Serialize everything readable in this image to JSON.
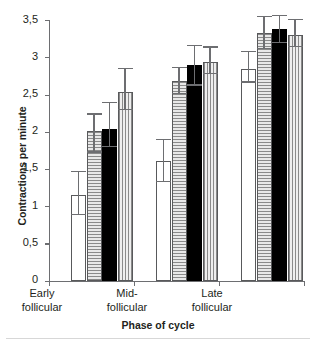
{
  "chart_data": {
    "type": "bar",
    "title": "",
    "xlabel": "Phase of cycle",
    "ylabel": "Contractions per minute",
    "categories": [
      "Early follicular",
      "Mid-follicular",
      "Late follicular"
    ],
    "ylim": [
      0,
      3.5
    ],
    "yticks": [
      0,
      0.5,
      1,
      1.5,
      2,
      2.5,
      3,
      3.5
    ],
    "ytick_labels": [
      "0",
      "0,5",
      "1",
      "1,5",
      "2",
      "2,5",
      "3",
      "3,5"
    ],
    "grid": false,
    "legend": "none",
    "decimal_separator": ",",
    "series": [
      {
        "name": "series-1",
        "fill": "white",
        "values": [
          1.15,
          1.6,
          2.84
        ],
        "err_low": [
          0.88,
          1.33,
          2.66
        ],
        "err_high": [
          1.46,
          1.89,
          3.07
        ]
      },
      {
        "name": "series-2",
        "fill": "horizontal-stripes",
        "values": [
          2.01,
          2.68,
          3.32
        ],
        "err_low": [
          1.72,
          2.51,
          3.11
        ],
        "err_high": [
          2.23,
          2.86,
          3.54
        ]
      },
      {
        "name": "series-3",
        "fill": "black",
        "values": [
          2.04,
          2.89,
          3.38
        ],
        "err_low": [
          1.8,
          2.62,
          3.19
        ],
        "err_high": [
          2.38,
          3.15,
          3.55
        ]
      },
      {
        "name": "series-4",
        "fill": "vertical-stripes",
        "values": [
          2.54,
          2.93,
          3.3
        ],
        "err_low": [
          2.29,
          2.78,
          3.14
        ],
        "err_high": [
          2.84,
          3.13,
          3.5
        ]
      }
    ]
  },
  "axis": {
    "y_title": "Contractions per minute",
    "x_title": "Phase of cycle",
    "tick_labels": {
      "y": [
        "3,5",
        "3",
        "2,5",
        "2",
        "1,5",
        "1",
        "0,5",
        "0"
      ],
      "x": [
        {
          "line1": "Early",
          "line2": "follicular"
        },
        {
          "line1": "Mid-",
          "line2": "follicular"
        },
        {
          "line1": "Late",
          "line2": "follicular"
        }
      ]
    }
  },
  "colors": {
    "axis": "#6d6e71",
    "text": "#231f20",
    "bar_black": "#000000",
    "bar_white": "#ffffff",
    "bar_stripe": "#d9d9d9"
  }
}
